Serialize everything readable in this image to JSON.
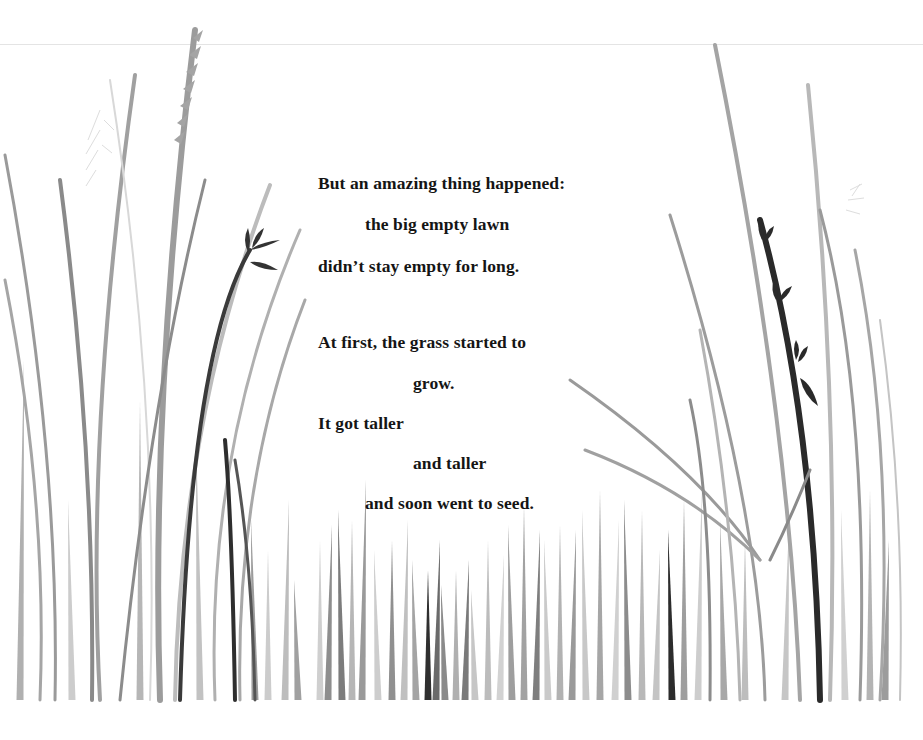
{
  "story": {
    "stanza1": [
      {
        "text": "But an amazing thing happened:",
        "x": 318,
        "y": 173
      },
      {
        "text": "the big empty lawn",
        "x": 365,
        "y": 214
      },
      {
        "text": "didn’t stay empty for long.",
        "x": 318,
        "y": 256
      }
    ],
    "stanza2": [
      {
        "text": "At first, the grass started to",
        "x": 318,
        "y": 332
      },
      {
        "text": "grow.",
        "x": 413,
        "y": 373
      },
      {
        "text": "It got taller",
        "x": 318,
        "y": 413
      },
      {
        "text": "and taller",
        "x": 413,
        "y": 453
      },
      {
        "text": "and soon went to seed.",
        "x": 365,
        "y": 493
      }
    ]
  },
  "palette": {
    "background": "#ffffff",
    "text": "#151515",
    "grass_dark": "#2b2b2b",
    "grass_mid": "#7a7a7a",
    "grass_light": "#a8a8a8",
    "grass_pale": "#cfcfcf",
    "rule": "#e4e4e4"
  },
  "illustration": {
    "tall_blades": [
      {
        "d": "M92,700 Q95,450 60,180",
        "c": "#8a8a8a",
        "w": 4
      },
      {
        "d": "M55,700 Q60,450 5,155",
        "c": "#9a9a9a",
        "w": 3
      },
      {
        "d": "M40,700 Q48,500 5,280",
        "c": "#a5a5a5",
        "w": 3
      },
      {
        "d": "M100,700 Q85,430 135,75",
        "c": "#a0a0a0",
        "w": 4
      },
      {
        "d": "M160,700 Q150,400 195,30",
        "c": "#9c9c9c",
        "w": 6
      },
      {
        "d": "M150,700 Q160,400 110,80",
        "c": "#d8d8d8",
        "w": 2
      },
      {
        "d": "M120,700 Q150,400 205,180",
        "c": "#8c8c8c",
        "w": 3
      },
      {
        "d": "M175,700 Q180,420 270,185",
        "c": "#bcbcbc",
        "w": 4
      },
      {
        "d": "M180,700 Q190,350 250,250",
        "c": "#3a3a3a",
        "w": 4
      },
      {
        "d": "M215,700 Q205,450 300,230",
        "c": "#b0b0b0",
        "w": 3
      },
      {
        "d": "M240,700 Q235,480 305,300",
        "c": "#a8a8a8",
        "w": 3
      },
      {
        "d": "M235,700 Q232,520 225,440",
        "c": "#2e2e2e",
        "w": 4
      },
      {
        "d": "M255,700 Q252,560 235,460",
        "c": "#555555",
        "w": 3
      },
      {
        "d": "M820,700 Q815,420 760,220",
        "c": "#2a2a2a",
        "w": 6
      },
      {
        "d": "M800,700 Q790,420 715,45",
        "c": "#a4a4a4",
        "w": 4
      },
      {
        "d": "M830,700 Q840,400 808,85",
        "c": "#b8b8b8",
        "w": 4
      },
      {
        "d": "M860,700 Q870,400 820,210",
        "c": "#9a9a9a",
        "w": 3
      },
      {
        "d": "M880,700 Q895,450 855,250",
        "c": "#a6a6a6",
        "w": 3
      },
      {
        "d": "M765,700 Q760,500 670,215",
        "c": "#9c9c9c",
        "w": 3
      },
      {
        "d": "M760,560 Q700,470 570,380",
        "c": "#9a9a9a",
        "w": 3
      },
      {
        "d": "M760,560 Q690,490 585,450",
        "c": "#a0a0a0",
        "w": 3
      },
      {
        "d": "M710,700 Q712,500 690,400",
        "c": "#8c8c8c",
        "w": 3
      },
      {
        "d": "M740,700 Q735,520 700,330",
        "c": "#b4b4b4",
        "w": 3
      },
      {
        "d": "M900,700 Q905,500 880,320",
        "c": "#c4c4c4",
        "w": 2
      },
      {
        "d": "M770,560 Q790,520 810,470",
        "c": "#8a8a8a",
        "w": 3
      }
    ],
    "short_blades": [
      {
        "x": 255,
        "h": 180,
        "c": "#9c9c9c"
      },
      {
        "x": 268,
        "h": 150,
        "c": "#cccccc"
      },
      {
        "x": 285,
        "h": 200,
        "c": "#bdbdbd"
      },
      {
        "x": 298,
        "h": 120,
        "c": "#a0a0a0"
      },
      {
        "x": 320,
        "h": 160,
        "c": "#cfcfcf"
      },
      {
        "x": 328,
        "h": 175,
        "c": "#8e8e8e"
      },
      {
        "x": 342,
        "h": 190,
        "c": "#7c7c7c"
      },
      {
        "x": 352,
        "h": 180,
        "c": "#b6b6b6"
      },
      {
        "x": 362,
        "h": 220,
        "c": "#9a9a9a"
      },
      {
        "x": 378,
        "h": 150,
        "c": "#cdcdcd"
      },
      {
        "x": 392,
        "h": 160,
        "c": "#909090"
      },
      {
        "x": 404,
        "h": 180,
        "c": "#c0c0c0"
      },
      {
        "x": 416,
        "h": 140,
        "c": "#a4a4a4"
      },
      {
        "x": 428,
        "h": 130,
        "c": "#2f2f2f"
      },
      {
        "x": 436,
        "h": 160,
        "c": "#6a6a6a"
      },
      {
        "x": 445,
        "h": 115,
        "c": "#8a8a8a"
      },
      {
        "x": 456,
        "h": 130,
        "c": "#b0b0b0"
      },
      {
        "x": 465,
        "h": 140,
        "c": "#7a7a7a"
      },
      {
        "x": 475,
        "h": 110,
        "c": "#c6c6c6"
      },
      {
        "x": 488,
        "h": 160,
        "c": "#bcbcbc"
      },
      {
        "x": 500,
        "h": 145,
        "c": "#d2d2d2"
      },
      {
        "x": 512,
        "h": 175,
        "c": "#9e9e9e"
      },
      {
        "x": 524,
        "h": 195,
        "c": "#a2a2a2"
      },
      {
        "x": 536,
        "h": 170,
        "c": "#7e7e7e"
      },
      {
        "x": 548,
        "h": 160,
        "c": "#cacaca"
      },
      {
        "x": 560,
        "h": 175,
        "c": "#b2b2b2"
      },
      {
        "x": 572,
        "h": 170,
        "c": "#9a9a9a"
      },
      {
        "x": 586,
        "h": 190,
        "c": "#c8c8c8"
      },
      {
        "x": 600,
        "h": 210,
        "c": "#a6a6a6"
      },
      {
        "x": 615,
        "h": 180,
        "c": "#d0d0d0"
      },
      {
        "x": 628,
        "h": 200,
        "c": "#8c8c8c"
      },
      {
        "x": 642,
        "h": 190,
        "c": "#b8b8b8"
      },
      {
        "x": 656,
        "h": 150,
        "c": "#c4c4c4"
      },
      {
        "x": 672,
        "h": 170,
        "c": "#2c2c2c"
      },
      {
        "x": 684,
        "h": 200,
        "c": "#9e9e9e"
      },
      {
        "x": 698,
        "h": 210,
        "c": "#cdcdcd"
      },
      {
        "x": 724,
        "h": 180,
        "c": "#a8a8a8"
      },
      {
        "x": 745,
        "h": 160,
        "c": "#bdbdbd"
      },
      {
        "x": 785,
        "h": 175,
        "c": "#c6c6c6"
      },
      {
        "x": 845,
        "h": 190,
        "c": "#d0d0d0"
      },
      {
        "x": 870,
        "h": 210,
        "c": "#b4b4b4"
      },
      {
        "x": 885,
        "h": 160,
        "c": "#9c9c9c"
      },
      {
        "x": 200,
        "h": 260,
        "c": "#c2c2c2"
      },
      {
        "x": 140,
        "h": 300,
        "c": "#b6b6b6"
      },
      {
        "x": 20,
        "h": 340,
        "c": "#b0b0b0"
      },
      {
        "x": 72,
        "h": 200,
        "c": "#cccccc"
      }
    ]
  }
}
